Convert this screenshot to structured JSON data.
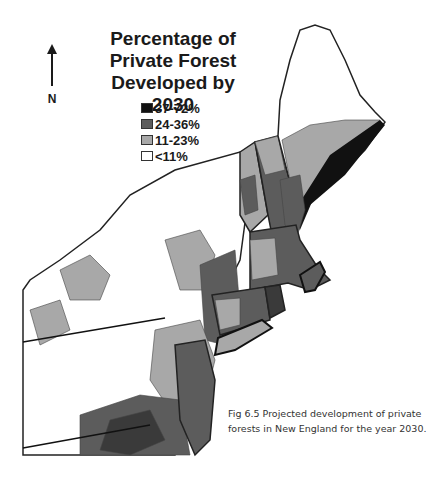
{
  "map": {
    "title_lines": [
      "Percentage of",
      "Private Forest",
      "Developed by 2030"
    ],
    "north_label": "N",
    "legend": [
      {
        "label": "37-72%",
        "color": "#111111"
      },
      {
        "label": "24-36%",
        "color": "#5c5c5c"
      },
      {
        "label": "11-23%",
        "color": "#a8a8a8"
      },
      {
        "label": "<11%",
        "color": "#ffffff"
      }
    ],
    "caption_lines": [
      "Fig 6.5  Projected development of private",
      "forests in New England for the year 2030."
    ]
  }
}
